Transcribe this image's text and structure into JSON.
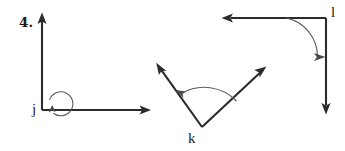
{
  "page": {
    "background_color": "#ffffff",
    "width": 345,
    "height": 151,
    "line_color": "#2b2b2b",
    "arc_color": "#5a5a5a"
  },
  "problem": {
    "number_label": "4."
  },
  "figures": [
    {
      "vertex_label": "j",
      "type": "reflex-angle",
      "vertex": [
        42,
        110
      ],
      "rays": [
        {
          "name": "ray-up",
          "direction": "up",
          "endpoint": [
            42,
            14
          ],
          "arrow": true
        },
        {
          "name": "ray-right",
          "direction": "right",
          "endpoint": [
            150,
            110
          ],
          "arrow": true
        }
      ],
      "arc": {
        "kind": "reflex",
        "sweep_degrees": 270,
        "arrow_on": "ray-right"
      }
    },
    {
      "vertex_label": "k",
      "type": "acute-angle",
      "vertex": [
        202,
        127
      ],
      "rays": [
        {
          "name": "ray-upper-left",
          "direction": "up-left",
          "endpoint": [
            157,
            64
          ],
          "arrow": true
        },
        {
          "name": "ray-upper-right",
          "direction": "up-right",
          "endpoint": [
            266,
            67
          ],
          "arrow": true
        }
      ],
      "arc": {
        "kind": "interior",
        "sweep_degrees": 72,
        "arrow_on": "ray-upper-left"
      }
    },
    {
      "vertex_label": "l",
      "type": "right-angle",
      "vertex": [
        326,
        18
      ],
      "rays": [
        {
          "name": "ray-left",
          "direction": "left",
          "endpoint": [
            222,
            18
          ],
          "arrow": true
        },
        {
          "name": "ray-down",
          "direction": "down",
          "endpoint": [
            326,
            114
          ],
          "arrow": true
        }
      ],
      "arc": {
        "kind": "interior",
        "sweep_degrees": 90,
        "arrow_on": "ray-down"
      }
    }
  ],
  "labels": {
    "problem_number": "4.",
    "vertex_j": "j",
    "vertex_k": "k",
    "vertex_l": "l"
  }
}
